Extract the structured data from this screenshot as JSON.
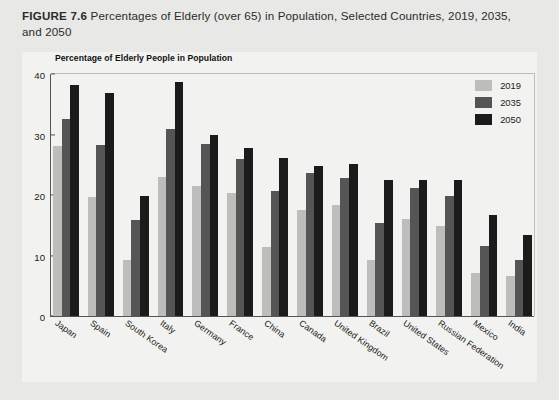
{
  "figure": {
    "number_label": "FIGURE 7.6",
    "caption_text": " Percentages of Elderly (over 65) in Population, Selected Countries, 2019, 2035, and 2050"
  },
  "axis_title": "Percentage of Elderly People in Population",
  "legend": {
    "entries": [
      {
        "label": "2019",
        "color": "#bdbdbb"
      },
      {
        "label": "2035",
        "color": "#555555"
      },
      {
        "label": "2050",
        "color": "#1b1b1b"
      }
    ]
  },
  "yticks": [
    "40",
    "30",
    "20",
    "10",
    "0"
  ],
  "chart_data": {
    "type": "bar",
    "title": "FIGURE 7.6 Percentages of Elderly (over 65) in Population, Selected Countries, 2019, 2035, and 2050",
    "subtitle": "Percentage of Elderly People in Population",
    "xlabel": "",
    "ylabel": "Percentage of Elderly People in Population",
    "ylim": [
      0,
      40
    ],
    "yticks": [
      0,
      10,
      20,
      30,
      40
    ],
    "grid": false,
    "legend_position": "top-right",
    "categories": [
      "Japan",
      "Spain",
      "South Korea",
      "Italy",
      "Germany",
      "France",
      "China",
      "Canada",
      "United Kingdom",
      "Brazil",
      "United States",
      "Russian Federation",
      "Mexico",
      "India"
    ],
    "series": [
      {
        "name": "2019",
        "color": "#bdbdbb",
        "values": [
          28.1,
          19.6,
          9.2,
          22.9,
          21.5,
          20.3,
          11.4,
          17.5,
          18.4,
          9.2,
          16.0,
          14.9,
          7.1,
          6.6
        ]
      },
      {
        "name": "2035",
        "color": "#555555",
        "values": [
          32.5,
          28.3,
          15.8,
          30.9,
          28.4,
          26.0,
          20.6,
          23.7,
          22.8,
          15.3,
          21.2,
          19.8,
          11.6,
          9.3
        ]
      },
      {
        "name": "2050",
        "color": "#1b1b1b",
        "values": [
          38.2,
          36.8,
          19.8,
          38.7,
          29.9,
          27.8,
          26.1,
          24.8,
          25.1,
          22.4,
          22.4,
          22.5,
          16.7,
          13.4
        ]
      }
    ]
  }
}
